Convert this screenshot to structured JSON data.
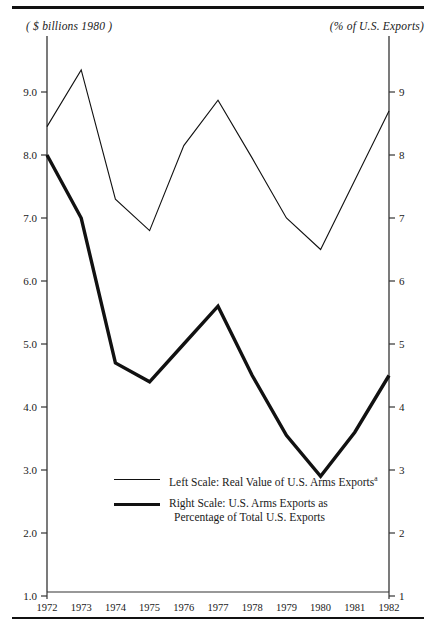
{
  "figure": {
    "left_unit_label": "( $ billions 1980 )",
    "right_unit_label": "(% of U.S. Exports)"
  },
  "legend": {
    "entries": [
      {
        "marker": "thin-line",
        "text_line1": "Left Scale: Real Value of U.S. Arms Exports",
        "footnote_marker": "a",
        "text_line2": ""
      },
      {
        "marker": "thick-line",
        "text_line1": "Right Scale:  U.S. Arms Exports as",
        "footnote_marker": "",
        "text_line2": "Percentage of Total U.S. Exports"
      }
    ]
  },
  "chart_data": {
    "type": "line",
    "title": "",
    "xlabel": "",
    "ylabel": "",
    "grid": false,
    "legend_position": "inside-bottom-center",
    "x": [
      "1972",
      "1973",
      "1974",
      "1975",
      "1976",
      "1977",
      "1978",
      "1979",
      "1980",
      "1981",
      "1982"
    ],
    "left_axis": {
      "label": "( $ billions 1980 )",
      "ticks": [
        "1.0",
        "2.0",
        "3.0",
        "4.0",
        "5.0",
        "6.0",
        "7.0",
        "8.0",
        "9.0"
      ],
      "tick_values": [
        1,
        2,
        3,
        4,
        5,
        6,
        7,
        8,
        9
      ],
      "ylim": [
        0,
        10.1
      ]
    },
    "right_axis": {
      "label": "(% of U.S. Exports)",
      "ticks": [
        "1",
        "2",
        "3",
        "4",
        "5",
        "6",
        "7",
        "8",
        "9"
      ],
      "tick_values": [
        1,
        2,
        3,
        4,
        5,
        6,
        7,
        8,
        9
      ],
      "ylim": [
        0,
        10.1
      ]
    },
    "series": [
      {
        "name": "Left Scale: Real Value of U.S. Arms Exports",
        "axis": "left",
        "style": "thin",
        "values": [
          8.45,
          9.35,
          7.3,
          6.8,
          8.15,
          8.87,
          7.95,
          7.0,
          6.5,
          7.6,
          8.7
        ]
      },
      {
        "name": "Right Scale: U.S. Arms Exports as Percentage of Total U.S. Exports",
        "axis": "right",
        "style": "thick",
        "values": [
          8.0,
          7.0,
          4.7,
          4.4,
          5.0,
          5.6,
          4.5,
          3.55,
          2.9,
          3.6,
          4.5
        ]
      }
    ]
  }
}
